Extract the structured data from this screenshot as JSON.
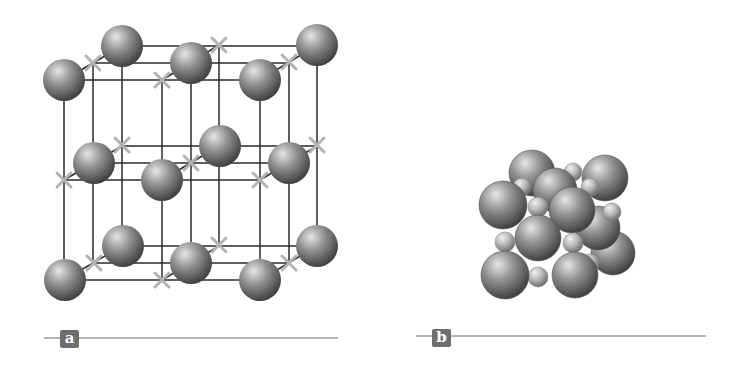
{
  "colors": {
    "background": "#ffffff",
    "lattice_line": "#2a2a2a",
    "cross_mark": "#b3b3b3",
    "sphere_highlight": "#e6e6e6",
    "sphere_mid": "#929292",
    "sphere_shadow": "#3e3e3e",
    "small_sphere_highlight": "#f0f0f0",
    "small_sphere_mid": "#b8b8b8",
    "small_sphere_shadow": "#6a6a6a",
    "label_box": "#6e6e6e",
    "label_text": "#ffffff",
    "rule": "#b4b4b4"
  },
  "panels": [
    {
      "id": "a",
      "label": "a",
      "description": "Expanded lattice: large spheres at alternating sites, X marks at the other sites, connected by grid lines",
      "label_box": {
        "x": 60,
        "y": 330
      },
      "rule": {
        "x1": 44,
        "x2": 338,
        "y": 337
      }
    },
    {
      "id": "b",
      "label": "b",
      "description": "Space-filling packed model of the same unit cell with large and small spheres",
      "label_box": {
        "x": 432,
        "y": 329
      },
      "rule": {
        "x1": 416,
        "x2": 706,
        "y": 335
      }
    }
  ],
  "lattice_a": {
    "sphere_radius": 21,
    "cross_half": 7,
    "layers": [
      {
        "name": "top",
        "spheres": [
          [
            122,
            46
          ],
          [
            317,
            45
          ],
          [
            191,
            63
          ],
          [
            64,
            80
          ],
          [
            260,
            80
          ]
        ],
        "crosses": [
          [
            219,
            45
          ],
          [
            93,
            63
          ],
          [
            289,
            62
          ],
          [
            162,
            80
          ]
        ],
        "rows": [
          [
            122,
            317,
            46
          ],
          [
            93,
            289,
            63
          ],
          [
            64,
            260,
            80
          ]
        ],
        "depth": [
          [
            64,
            80,
            122,
            46
          ],
          [
            162,
            80,
            219,
            45
          ],
          [
            260,
            80,
            317,
            45
          ]
        ]
      },
      {
        "name": "middle",
        "spheres": [
          [
            220,
            146
          ],
          [
            94,
            163
          ],
          [
            289,
            163
          ],
          [
            162,
            180
          ]
        ],
        "crosses": [
          [
            122,
            145
          ],
          [
            317,
            145
          ],
          [
            191,
            163
          ],
          [
            64,
            180
          ],
          [
            260,
            180
          ]
        ],
        "rows": [
          [
            122,
            317,
            146
          ],
          [
            93,
            289,
            163
          ],
          [
            64,
            260,
            180
          ]
        ],
        "depth": [
          [
            64,
            180,
            122,
            146
          ],
          [
            162,
            180,
            219,
            146
          ],
          [
            260,
            180,
            317,
            146
          ]
        ]
      },
      {
        "name": "bottom",
        "spheres": [
          [
            123,
            246
          ],
          [
            317,
            246
          ],
          [
            191,
            263
          ],
          [
            65,
            280
          ],
          [
            260,
            280
          ]
        ],
        "crosses": [
          [
            219,
            245
          ],
          [
            94,
            263
          ],
          [
            289,
            263
          ],
          [
            162,
            280
          ]
        ],
        "rows": [
          [
            122,
            317,
            246
          ],
          [
            93,
            289,
            263
          ],
          [
            64,
            260,
            280
          ]
        ],
        "depth": [
          [
            64,
            280,
            122,
            246
          ],
          [
            162,
            280,
            219,
            246
          ],
          [
            260,
            280,
            317,
            246
          ]
        ]
      }
    ],
    "verticals": [
      [
        64,
        80,
        280
      ],
      [
        93,
        63,
        263
      ],
      [
        122,
        46,
        246
      ],
      [
        162,
        80,
        280
      ],
      [
        191,
        63,
        263
      ],
      [
        219,
        45,
        246
      ],
      [
        260,
        80,
        280
      ],
      [
        289,
        62,
        263
      ],
      [
        317,
        45,
        246
      ]
    ]
  },
  "packed_b": {
    "spheres_back_to_front": [
      {
        "x": 532,
        "y": 173,
        "r": 23,
        "size": "large"
      },
      {
        "x": 605,
        "y": 178,
        "r": 23,
        "size": "large"
      },
      {
        "x": 522,
        "y": 187,
        "r": 9,
        "size": "small"
      },
      {
        "x": 573,
        "y": 172,
        "r": 9,
        "size": "small"
      },
      {
        "x": 613,
        "y": 253,
        "r": 22,
        "size": "large"
      },
      {
        "x": 598,
        "y": 228,
        "r": 22,
        "size": "large"
      },
      {
        "x": 590,
        "y": 187,
        "r": 9,
        "size": "small"
      },
      {
        "x": 612,
        "y": 212,
        "r": 9,
        "size": "small"
      },
      {
        "x": 555,
        "y": 190,
        "r": 22,
        "size": "large"
      },
      {
        "x": 590,
        "y": 263,
        "r": 9,
        "size": "small"
      },
      {
        "x": 538,
        "y": 207,
        "r": 10,
        "size": "small"
      },
      {
        "x": 503,
        "y": 205,
        "r": 24,
        "size": "large"
      },
      {
        "x": 572,
        "y": 210,
        "r": 23,
        "size": "large"
      },
      {
        "x": 505,
        "y": 242,
        "r": 10,
        "size": "small"
      },
      {
        "x": 573,
        "y": 243,
        "r": 10,
        "size": "small"
      },
      {
        "x": 538,
        "y": 238,
        "r": 23,
        "size": "large"
      },
      {
        "x": 538,
        "y": 277,
        "r": 10,
        "size": "small"
      },
      {
        "x": 505,
        "y": 275,
        "r": 24,
        "size": "large"
      },
      {
        "x": 575,
        "y": 275,
        "r": 23,
        "size": "large"
      }
    ]
  }
}
